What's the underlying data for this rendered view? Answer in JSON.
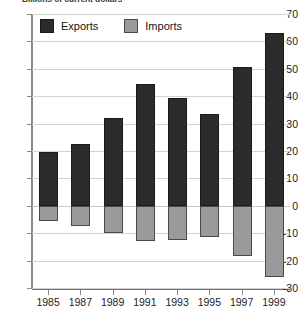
{
  "chart_data": {
    "type": "bar",
    "title": "Billions of current dollars",
    "xlabel": "",
    "ylabel": "",
    "ylim": [
      -30,
      70
    ],
    "ytick_step": 10,
    "grid": true,
    "stacked_diverging": true,
    "legend_position": "top-left",
    "categories": [
      "1985",
      "1987",
      "1989",
      "1991",
      "1993",
      "1995",
      "1997",
      "1999"
    ],
    "yticks": [
      "70",
      "60",
      "50",
      "40",
      "30",
      "20",
      "10",
      "0",
      "-10",
      "-20",
      "-30"
    ],
    "series": [
      {
        "name": "Exports",
        "color": "#2b2b2b",
        "values": [
          19.5,
          22.5,
          32.0,
          44.5,
          39.5,
          33.5,
          50.5,
          63.0
        ]
      },
      {
        "name": "Imports",
        "color": "#9a9a9a",
        "values": [
          -5.5,
          -7.5,
          -10.0,
          -13.0,
          -12.5,
          -11.5,
          -18.5,
          -26.0
        ]
      }
    ]
  }
}
